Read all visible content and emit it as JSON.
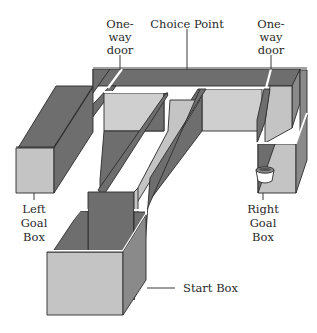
{
  "figure": {
    "type": "T-maze apparatus (isometric drawing)",
    "labels": {
      "one_way_door_left": [
        "One-",
        "way",
        "door"
      ],
      "choice_point": "Choice Point",
      "one_way_door_right": [
        "One-",
        "way",
        "door"
      ],
      "left_goal_box": [
        "Left",
        "Goal",
        "Box"
      ],
      "right_goal_box": [
        "Right",
        "Goal",
        "Box"
      ],
      "start_box": "Start Box"
    },
    "colors": {
      "wall_shadow": "#6e6e6e",
      "wall_side": "#8a8a8a",
      "floor_face": "#c4c4c4",
      "rim": "#ffffff",
      "outline": "#2b2b2b",
      "background": "#ffffff"
    },
    "objects": {
      "food_cup": "food-cup-in-right-goal-box"
    }
  }
}
